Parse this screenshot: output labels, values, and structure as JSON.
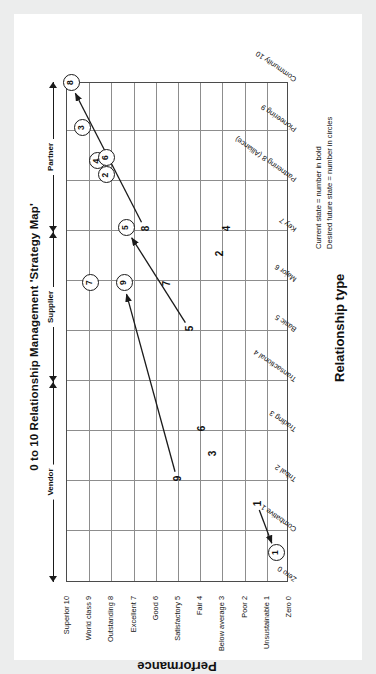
{
  "figure": {
    "title": "0 to 10 Relationship Management 'Strategy Map'",
    "x_axis_title": "Relationship type",
    "y_axis_title": "Performance"
  },
  "legend": {
    "line1": "Current state = number in bold",
    "line2": "Desired future state = number in circles"
  },
  "bands": [
    {
      "name": "Vendor"
    },
    {
      "name": "Supplier"
    },
    {
      "name": "Partner"
    }
  ],
  "chart_data": {
    "type": "scatter",
    "title": "0 to 10 Relationship Management 'Strategy Map'",
    "xlabel": "Relationship type",
    "ylabel": "Performance",
    "xlim": [
      0,
      10
    ],
    "ylim": [
      0,
      10
    ],
    "grid": true,
    "legend_position": "below-right",
    "x_tick_labels": [
      "Zero 0",
      "Combative 1",
      "Tribal 2",
      "Trading 3",
      "Transactional 4",
      "Basic 5",
      "Major 6",
      "Key 7",
      "Partnering 8 (Alliance)",
      "Pioneering 9",
      "Community 10"
    ],
    "y_tick_labels": [
      "Zero 0",
      "Unsustainable 1",
      "Poor 2",
      "Below average 3",
      "Fair 4",
      "Satisfactory 5",
      "Good 6",
      "Excellent 7",
      "Outstanding 8",
      "World class 9",
      "Superior 10"
    ],
    "group_bands": [
      {
        "label": "Vendor",
        "x_from": 0,
        "x_to": 4
      },
      {
        "label": "Supplier",
        "x_from": 4,
        "x_to": 7
      },
      {
        "label": "Partner",
        "x_from": 7,
        "x_to": 10
      }
    ],
    "annotations": [
      "Current state = number in bold",
      "Desired future state = number in circles"
    ],
    "series": [
      {
        "name": "Current state (number in bold)",
        "marker": "bold-number",
        "points": [
          {
            "label": "1",
            "x": 1.55,
            "y": 1.45
          },
          {
            "label": "2",
            "x": 6.55,
            "y": 3.15
          },
          {
            "label": "3",
            "x": 2.55,
            "y": 3.45
          },
          {
            "label": "4",
            "x": 7.05,
            "y": 2.85
          },
          {
            "label": "5",
            "x": 5.05,
            "y": 4.5
          },
          {
            "label": "6",
            "x": 3.05,
            "y": 3.95
          },
          {
            "label": "7",
            "x": 5.95,
            "y": 5.55
          },
          {
            "label": "8",
            "x": 7.05,
            "y": 6.5
          },
          {
            "label": "9",
            "x": 2.05,
            "y": 5.05
          }
        ]
      },
      {
        "name": "Desired future state (number in circles)",
        "marker": "circled-number",
        "points": [
          {
            "label": "1",
            "x": 0.55,
            "y": 0.6
          },
          {
            "label": "2",
            "x": 8.1,
            "y": 8.25
          },
          {
            "label": "3",
            "x": 9.05,
            "y": 9.35
          },
          {
            "label": "4",
            "x": 8.38,
            "y": 8.65
          },
          {
            "label": "5",
            "x": 7.05,
            "y": 7.35
          },
          {
            "label": "6",
            "x": 8.45,
            "y": 8.25
          },
          {
            "label": "7",
            "x": 5.95,
            "y": 9.0
          },
          {
            "label": "8",
            "x": 9.95,
            "y": 9.85
          },
          {
            "label": "9",
            "x": 5.95,
            "y": 7.45
          }
        ]
      }
    ],
    "transitions": [
      {
        "label": "1",
        "from": {
          "x": 1.55,
          "y": 1.45
        },
        "to": {
          "x": 0.55,
          "y": 0.6
        }
      },
      {
        "label": "5",
        "from": {
          "x": 5.05,
          "y": 4.5
        },
        "to": {
          "x": 7.05,
          "y": 7.35
        }
      },
      {
        "label": "8",
        "from": {
          "x": 7.05,
          "y": 6.5
        },
        "to": {
          "x": 9.95,
          "y": 9.85
        }
      },
      {
        "label": "9",
        "from": {
          "x": 2.05,
          "y": 5.05
        },
        "to": {
          "x": 5.95,
          "y": 7.45
        }
      }
    ]
  }
}
